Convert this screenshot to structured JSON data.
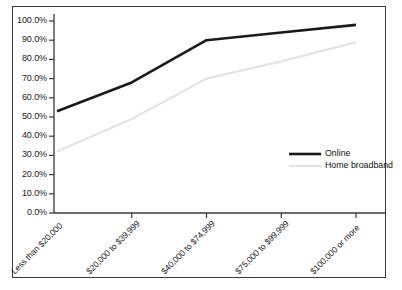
{
  "chart_data": {
    "type": "line",
    "title": "",
    "subtitle": "",
    "xlabel": "",
    "ylabel": "",
    "grid": false,
    "legend_position": "inside-right",
    "categories": [
      "Less than $20,000",
      "$20,000 to $39,999",
      "$40,000 to $74,999",
      "$75,000 to $99,999",
      "$100,000 or more"
    ],
    "ylim": [
      0,
      100
    ],
    "ytick_labels": [
      "100.0%",
      "90.0%",
      "80.0%",
      "70.0%",
      "60.0%",
      "50.0%",
      "40.0%",
      "30.0%",
      "20.0%",
      "10.0%",
      "0.0%"
    ],
    "ytick_values": [
      100,
      90,
      80,
      70,
      60,
      50,
      40,
      30,
      20,
      10,
      0
    ],
    "series": [
      {
        "name": "Online",
        "color": "#1a1a1a",
        "width": 2.6,
        "values": [
          53,
          68,
          90,
          94,
          98
        ]
      },
      {
        "name": "Home broadband",
        "color": "#e3e3e3",
        "width": 2.2,
        "values": [
          32,
          49,
          70,
          79,
          89
        ]
      }
    ]
  },
  "legend": {
    "items": [
      {
        "label": "Online"
      },
      {
        "label": "Home broadband"
      }
    ]
  },
  "colors": {
    "online": "#1a1a1a",
    "home_broadband": "#e3e3e3",
    "axis": "#3a3a3a",
    "frame": "#3a3a3a",
    "text": "#1a1a1a"
  }
}
